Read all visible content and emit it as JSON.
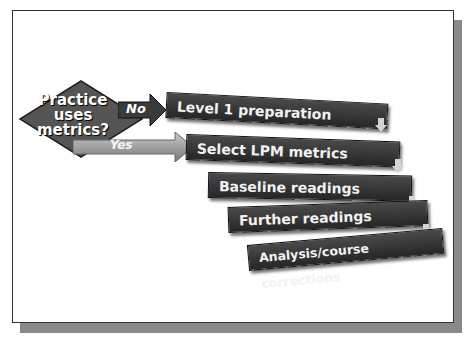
{
  "diagram": {
    "type": "flowchart",
    "decision": {
      "label_lines": [
        "Practice",
        "uses",
        "metrics?"
      ],
      "shape": "diamond",
      "color": "#555555"
    },
    "branches": {
      "no": {
        "label": "No",
        "target": "Level 1 preparation",
        "color": "#3a3a3a"
      },
      "yes": {
        "label": "Yes",
        "target": "Select LPM metrics",
        "color": "#8c8c8c"
      }
    },
    "steps": [
      {
        "label": "Level 1 preparation"
      },
      {
        "label": "Select LPM metrics"
      },
      {
        "label": "Baseline readings"
      },
      {
        "label": "Further readings"
      },
      {
        "label": "Analysis/course corrections"
      }
    ],
    "connector_icon": "down-arrow-icon",
    "colors": {
      "box": "#2e2e2e",
      "box_text": "#f2f2f2",
      "frame_shadow": "#8a8a8a",
      "connector": "#cfcfcf"
    }
  }
}
